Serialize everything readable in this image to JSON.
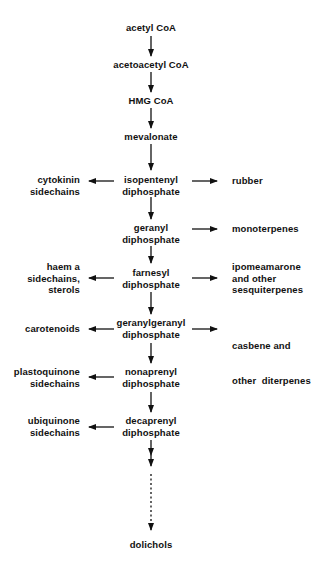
{
  "diagram": {
    "type": "pathway",
    "main_chain": [
      {
        "id": "acetyl-coa",
        "lines": [
          "acetyl CoA"
        ]
      },
      {
        "id": "acetoacetyl-coa",
        "lines": [
          "acetoacetyl CoA"
        ]
      },
      {
        "id": "hmg-coa",
        "lines": [
          "HMG CoA"
        ]
      },
      {
        "id": "mevalonate",
        "lines": [
          "mevalonate"
        ]
      },
      {
        "id": "isopentenyl-diphosphate",
        "lines": [
          "isopentenyl",
          "diphosphate"
        ]
      },
      {
        "id": "geranyl-diphosphate",
        "lines": [
          "geranyl",
          "diphosphate"
        ]
      },
      {
        "id": "farnesyl-diphosphate",
        "lines": [
          "farnesyl",
          "diphosphate"
        ]
      },
      {
        "id": "geranylgeranyl-diphosphate",
        "lines": [
          "geranylgeranyl",
          "diphosphate"
        ]
      },
      {
        "id": "nonaprenyl-diphosphate",
        "lines": [
          "nonaprenyl",
          "diphosphate"
        ]
      },
      {
        "id": "decaprenyl-diphosphate",
        "lines": [
          "decaprenyl",
          "diphosphate"
        ]
      },
      {
        "id": "dolichols",
        "lines": [
          "dolichols"
        ]
      }
    ],
    "left_branches": [
      {
        "from": "isopentenyl-diphosphate",
        "lines": [
          "cytokinin",
          "sidechains"
        ]
      },
      {
        "from": "farnesyl-diphosphate",
        "lines": [
          "haem a",
          "sidechains,",
          "sterols"
        ]
      },
      {
        "from": "geranylgeranyl-diphosphate",
        "lines": [
          "carotenoids"
        ]
      },
      {
        "from": "nonaprenyl-diphosphate",
        "lines": [
          "plastoquinone",
          "sidechains"
        ]
      },
      {
        "from": "decaprenyl-diphosphate",
        "lines": [
          "ubiquinone",
          "sidechains"
        ]
      }
    ],
    "right_branches": [
      {
        "from": "isopentenyl-diphosphate",
        "lines": [
          "rubber"
        ]
      },
      {
        "from": "geranyl-diphosphate",
        "lines": [
          "monoterpenes"
        ]
      },
      {
        "from": "farnesyl-diphosphate",
        "lines": [
          "ipomeamarone",
          "and other",
          "sesquiterpenes"
        ]
      },
      {
        "from": "geranylgeranyl-diphosphate",
        "lines": [
          "casbene and",
          "other  diterpenes"
        ]
      }
    ],
    "final_step_style": "dashed, multiple steps"
  }
}
